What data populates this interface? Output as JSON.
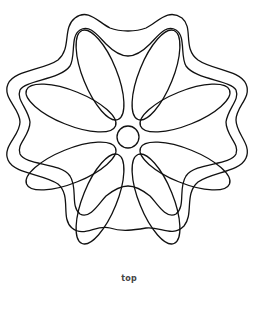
{
  "figure": {
    "caption": "top",
    "petal_count": 8,
    "line_color": "#111111",
    "background_color": "#ffffff"
  }
}
